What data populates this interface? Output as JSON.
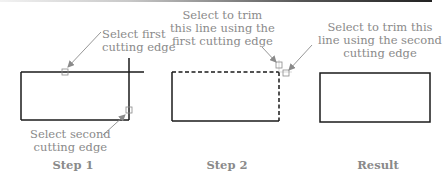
{
  "figure": {
    "colors": {
      "geometry": "#1a1a1a",
      "callout_text": "#8a8a8a",
      "arrow": "#8a8a8a"
    },
    "panels": [
      {
        "id": "step1",
        "label": "Step 1",
        "callouts": [
          {
            "text": "Select first\ncutting edge"
          },
          {
            "text": "Select second\ncutting edge"
          }
        ]
      },
      {
        "id": "step2",
        "label": "Step 2",
        "callouts": [
          {
            "text": "Select to trim\nthis line using the\nfirst cutting edge"
          }
        ]
      },
      {
        "id": "result",
        "label": "Result",
        "callouts": [
          {
            "text": "Select to trim this\nline using the second\ncutting edge"
          }
        ]
      }
    ]
  }
}
